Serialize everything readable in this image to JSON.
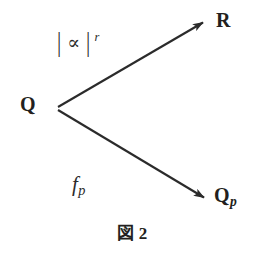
{
  "figure": {
    "caption_symbol": "図",
    "caption_number": "2",
    "caption_full": "図 2",
    "background_color": "#ffffff",
    "ink_color": "#231f20",
    "line_color": "#2b2b2b"
  },
  "nodes": {
    "origin": {
      "label": "Q",
      "x": 57,
      "y": 108
    },
    "target_upper": {
      "label": "R",
      "x": 207,
      "y": 20
    },
    "target_lower": {
      "label": "Q",
      "subscript": "p",
      "x": 208,
      "y": 200
    }
  },
  "edges": {
    "upper": {
      "label_bar_left": "|",
      "label_symbol": "∝",
      "label_bar_right": "|",
      "label_superscript": "r",
      "label_full": "| ∝ |  r",
      "from": "Q",
      "to": "R",
      "arrowhead": true
    },
    "lower": {
      "label_base": "f",
      "label_subscript": "p",
      "label_full": "f p",
      "from": "Q",
      "to": "Q p",
      "arrowhead": true
    }
  },
  "geometry": {
    "vertex_x": 57,
    "vertex_y": 108,
    "upper_tip_x": 207,
    "upper_tip_y": 20,
    "lower_tip_x": 208,
    "lower_tip_y": 200,
    "stroke_width": 2.1
  }
}
